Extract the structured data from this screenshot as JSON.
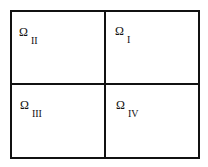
{
  "diagram": {
    "type": "domain-partition",
    "line_color": "#111111",
    "background": "#ffffff",
    "regions": [
      {
        "position": "top-left",
        "symbol": "Ω",
        "subscript": "II"
      },
      {
        "position": "top-right",
        "symbol": "Ω",
        "subscript": "I"
      },
      {
        "position": "bottom-left",
        "symbol": "Ω",
        "subscript": "III"
      },
      {
        "position": "bottom-right",
        "symbol": "Ω",
        "subscript": "IV"
      }
    ]
  }
}
